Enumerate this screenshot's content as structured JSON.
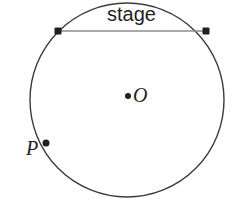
{
  "diagram": {
    "type": "geometry-circle",
    "background_color": "#ffffff",
    "circle": {
      "name": "main-circle",
      "center_x": 127,
      "center_y": 100,
      "radius": 97,
      "stroke_color": "#3b3b3b",
      "stroke_width": 1.4,
      "fill": "none"
    },
    "chord": {
      "name": "stage-chord",
      "label": "stage",
      "x1": 58,
      "y1": 31,
      "x2": 206,
      "y2": 31,
      "stroke_color": "#8d8d8d",
      "stroke_width": 1.6
    },
    "points": [
      {
        "id": "chord-left",
        "label": "",
        "x": 58,
        "y": 31,
        "marker": "square-dot",
        "size": 7,
        "color": "#231f20"
      },
      {
        "id": "chord-right",
        "label": "",
        "x": 206,
        "y": 31,
        "marker": "square-dot",
        "size": 7,
        "color": "#231f20"
      },
      {
        "id": "center",
        "label": "O",
        "x": 128,
        "y": 96,
        "marker": "round-dot",
        "size": 6,
        "color": "#231f20"
      },
      {
        "id": "point-p",
        "label": "P",
        "x": 46,
        "y": 143,
        "marker": "round-dot",
        "size": 7,
        "color": "#231f20"
      }
    ],
    "labels": {
      "stage": "stage",
      "center": "O",
      "point_p": "P"
    }
  }
}
